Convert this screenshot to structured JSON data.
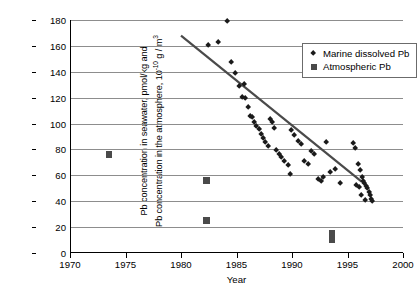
{
  "chart_data": {
    "type": "scatter",
    "title": "",
    "xlabel": "Year",
    "ylabel_line1": "Pb concentration in seawater, pmol/kg and",
    "ylabel_line2_pre": "Pb concentration in the atmosphere, 10",
    "ylabel_line2_sup": "-10",
    "ylabel_line2_post": " g / m",
    "ylabel_line2_sup2": "3",
    "xlim": [
      1970,
      2000
    ],
    "ylim": [
      0,
      180
    ],
    "xticks": [
      1970,
      1975,
      1980,
      1985,
      1990,
      1995,
      2000
    ],
    "yticks": [
      0,
      20,
      40,
      60,
      80,
      100,
      120,
      140,
      160,
      180
    ],
    "grid": "horizontal",
    "legend_position": "top-right",
    "series": [
      {
        "name": "Marine dissolved Pb",
        "marker": "diamond",
        "color": "#1a1a1a",
        "points": [
          [
            1982.5,
            160
          ],
          [
            1983.4,
            162
          ],
          [
            1984.2,
            178
          ],
          [
            1984.6,
            147
          ],
          [
            1985.0,
            138
          ],
          [
            1985.3,
            128
          ],
          [
            1985.6,
            120
          ],
          [
            1985.9,
            119
          ],
          [
            1986.1,
            112
          ],
          [
            1986.3,
            105
          ],
          [
            1986.5,
            104
          ],
          [
            1986.7,
            100
          ],
          [
            1986.9,
            97
          ],
          [
            1987.1,
            95
          ],
          [
            1987.3,
            91
          ],
          [
            1987.5,
            88
          ],
          [
            1987.7,
            85
          ],
          [
            1987.9,
            82
          ],
          [
            1988.1,
            103
          ],
          [
            1988.3,
            100
          ],
          [
            1988.5,
            96
          ],
          [
            1988.7,
            79
          ],
          [
            1988.9,
            76
          ],
          [
            1989.1,
            73
          ],
          [
            1989.4,
            70
          ],
          [
            1989.7,
            67
          ],
          [
            1990.0,
            94
          ],
          [
            1990.3,
            90
          ],
          [
            1990.6,
            86
          ],
          [
            1990.9,
            83
          ],
          [
            1991.2,
            70
          ],
          [
            1991.5,
            68
          ],
          [
            1991.8,
            78
          ],
          [
            1992.1,
            76
          ],
          [
            1992.4,
            56
          ],
          [
            1992.7,
            55
          ],
          [
            1993.2,
            85
          ],
          [
            1993.5,
            62
          ],
          [
            1994.0,
            64
          ],
          [
            1994.4,
            53
          ],
          [
            1995.6,
            84
          ],
          [
            1995.8,
            80
          ],
          [
            1996.0,
            68
          ],
          [
            1996.2,
            63
          ],
          [
            1996.4,
            58
          ],
          [
            1996.5,
            55
          ],
          [
            1996.6,
            53
          ],
          [
            1996.8,
            51
          ],
          [
            1996.9,
            49
          ],
          [
            1997.0,
            46
          ],
          [
            1997.1,
            44
          ],
          [
            1997.2,
            41
          ],
          [
            1997.3,
            39
          ],
          [
            1995.9,
            52
          ],
          [
            1996.1,
            50
          ],
          [
            1996.3,
            44
          ],
          [
            1996.7,
            40
          ],
          [
            1989.9,
            60
          ],
          [
            1992.9,
            58
          ],
          [
            1985.8,
            130
          ]
        ]
      },
      {
        "name": "Atmospheric Pb",
        "marker": "square",
        "color": "#4a4a4a",
        "points": [
          [
            1973.5,
            76
          ],
          [
            1982.3,
            56
          ],
          [
            1982.3,
            25
          ],
          [
            1993.6,
            15
          ],
          [
            1993.6,
            10
          ]
        ]
      }
    ],
    "trendline": {
      "x_start": 1980.0,
      "y_start": 168,
      "x_end": 1996.3,
      "y_end": 55,
      "color": "#4a4a4a"
    }
  }
}
